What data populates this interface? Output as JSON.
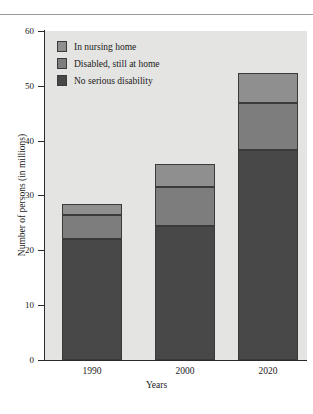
{
  "chart_data": {
    "type": "bar",
    "subtype": "stacked-bar",
    "title": "",
    "xlabel": "Years",
    "ylabel": "Number of persons (in millions)",
    "categories": [
      "1990",
      "2000",
      "2020"
    ],
    "series": [
      {
        "name": "No serious disability",
        "color": "#484848",
        "values": [
          22.0,
          24.5,
          38.3
        ]
      },
      {
        "name": "Disabled, still at home",
        "color": "#7d7d7d",
        "values": [
          4.5,
          7.0,
          8.6
        ]
      },
      {
        "name": "In nursing home",
        "color": "#8f8f8f",
        "values": [
          2.0,
          4.2,
          5.5
        ]
      }
    ],
    "totals": [
      28.5,
      35.7,
      52.4
    ],
    "ylim": [
      0,
      60
    ],
    "yticks": [
      "0",
      "10",
      "20",
      "30",
      "40",
      "50",
      "60"
    ],
    "ytick_values": [
      0,
      10,
      20,
      30,
      40,
      50,
      60
    ],
    "grid": false,
    "legend_position": "top-left",
    "plot_background": "#e4e4e2"
  },
  "legend": {
    "items": [
      {
        "label": "In nursing home",
        "color": "#8f8f8f"
      },
      {
        "label": "Disabled, still at home",
        "color": "#7d7d7d"
      },
      {
        "label": "No serious disability",
        "color": "#484848"
      }
    ]
  },
  "axes": {
    "y_title": "Number of persons (in millions)",
    "x_title": "Years",
    "y_labels": [
      "60",
      "50",
      "40",
      "30",
      "20",
      "10",
      "0"
    ],
    "x_labels": [
      "1990",
      "2000",
      "2020"
    ]
  }
}
